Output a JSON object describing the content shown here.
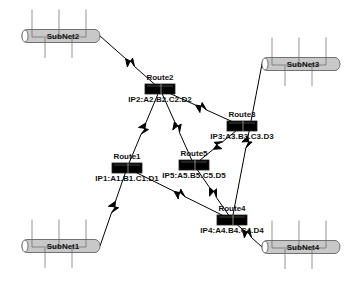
{
  "diagram": {
    "type": "network-topology",
    "colors": {
      "background": "#ffffff",
      "line": "#000000",
      "router_fill": "#000000",
      "router_highlight": "#555555",
      "subnet_fill": "#c8c8c8",
      "subnet_stroke": "#555555"
    },
    "subnets": [
      {
        "id": "subnet1",
        "label": "SubNet1",
        "x": 22,
        "y": 246,
        "w": 78
      },
      {
        "id": "subnet2",
        "label": "SubNet2",
        "x": 22,
        "y": 36,
        "w": 78
      },
      {
        "id": "subnet3",
        "label": "SubNet3",
        "x": 262,
        "y": 64,
        "w": 78
      },
      {
        "id": "subnet4",
        "label": "SubNet4",
        "x": 262,
        "y": 247,
        "w": 78
      }
    ],
    "routers": [
      {
        "id": "route1",
        "name": "Route1",
        "ip": "IP1:A1.B1.C1.D1",
        "cx": 127,
        "cy": 168
      },
      {
        "id": "route2",
        "name": "Route2",
        "ip": "IP2:A2.B2.C2.D2",
        "cx": 160,
        "cy": 89
      },
      {
        "id": "route3",
        "name": "Route3",
        "ip": "IP3:A3.B3.C3.D3",
        "cx": 242,
        "cy": 126
      },
      {
        "id": "route4",
        "name": "Route4",
        "ip": "IP4:A4.B4.C4.D4",
        "cx": 232,
        "cy": 220
      },
      {
        "id": "route5",
        "name": "Route5",
        "ip": "IP5:A5.B5.C5.D5",
        "cx": 194,
        "cy": 165
      }
    ],
    "links": [
      {
        "from": "subnet2",
        "to": "route2"
      },
      {
        "from": "route2",
        "to": "route1"
      },
      {
        "from": "route2",
        "to": "route5"
      },
      {
        "from": "route2",
        "to": "route3"
      },
      {
        "from": "subnet3",
        "to": "route4"
      },
      {
        "from": "route5",
        "to": "route3"
      },
      {
        "from": "route1",
        "to": "subnet1"
      },
      {
        "from": "route1",
        "to": "route4"
      },
      {
        "from": "route5",
        "to": "route4"
      },
      {
        "from": "route4",
        "to": "subnet4"
      }
    ]
  }
}
